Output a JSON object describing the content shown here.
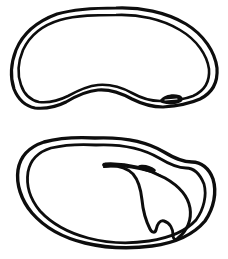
{
  "figure": {
    "title": "Bean seed",
    "caption": "",
    "background_color": "#ffffff",
    "ink_color": "#0d0d0d",
    "width": 228,
    "height": 259,
    "style": "black ink line drawing, double-contour outline",
    "view_count": 2
  },
  "chart_data": {
    "type": "line",
    "xlabel": "",
    "ylabel": "",
    "xlim": [
      0,
      228
    ],
    "ylim": [
      0,
      259
    ],
    "grid": false,
    "legend": "none",
    "series": [
      {
        "name": "top-seed-outer-contour",
        "closed": true,
        "stroke_width": 3.2,
        "x": [
          116,
          150,
          178,
          199,
          212,
          217,
          214,
          205,
          193,
          180,
          170,
          162,
          155,
          146,
          134,
          121,
          108,
          95,
          83,
          70,
          57,
          44,
          33,
          24,
          17,
          13,
          13,
          17,
          25,
          36,
          50,
          66,
          84,
          100
        ],
        "y": [
          8,
          9,
          17,
          31,
          48,
          66,
          81,
          93,
          100,
          104,
          106,
          107,
          107,
          105,
          100,
          94,
          90,
          90,
          94,
          100,
          105,
          108,
          107,
          101,
          91,
          78,
          64,
          50,
          38,
          28,
          20,
          14,
          10,
          8
        ]
      },
      {
        "name": "top-seed-inner-contour",
        "closed": true,
        "stroke_width": 2.6,
        "x": [
          116,
          148,
          173,
          192,
          204,
          209,
          206,
          198,
          187,
          175,
          166,
          158,
          150,
          141,
          130,
          118,
          106,
          94,
          83,
          71,
          59,
          47,
          37,
          29,
          23,
          20,
          20,
          24,
          32,
          42,
          55,
          70,
          86,
          101
        ],
        "y": [
          15,
          16,
          23,
          36,
          51,
          67,
          80,
          90,
          96,
          99,
          101,
          102,
          101,
          99,
          95,
          89,
          85,
          85,
          88,
          94,
          98,
          100,
          99,
          94,
          85,
          74,
          62,
          50,
          40,
          31,
          24,
          19,
          16,
          15
        ]
      },
      {
        "name": "top-seed-hilum-mark",
        "closed": true,
        "stroke_width": 1.6,
        "x": [
          163,
          168,
          174,
          179,
          182,
          181,
          177,
          171,
          166
        ],
        "y": [
          99,
          96,
          95,
          96,
          99,
          102,
          103,
          103,
          101
        ]
      },
      {
        "name": "bottom-seed-outer-contour",
        "closed": true,
        "stroke_width": 3.4,
        "x": [
          95,
          126,
          152,
          170,
          183,
          196,
          207,
          213,
          214,
          209,
          199,
          186,
          170,
          152,
          133,
          114,
          96,
          80,
          64,
          50,
          38,
          28,
          21,
          17,
          17,
          21,
          29,
          40,
          54,
          70,
          83
        ],
        "y": [
          138,
          139,
          146,
          156,
          161,
          162,
          167,
          178,
          192,
          206,
          219,
          230,
          238,
          243,
          246,
          247,
          246,
          243,
          238,
          231,
          222,
          211,
          198,
          184,
          171,
          160,
          151,
          145,
          140,
          138,
          137
        ]
      },
      {
        "name": "bottom-seed-inner-contour",
        "closed": true,
        "stroke_width": 2.8,
        "x": [
          96,
          124,
          148,
          165,
          178,
          190,
          199,
          204,
          205,
          200,
          191,
          179,
          164,
          148,
          130,
          112,
          95,
          80,
          66,
          53,
          42,
          33,
          27,
          24,
          24,
          28,
          36,
          46,
          59,
          73,
          85
        ],
        "y": [
          145,
          146,
          152,
          161,
          166,
          167,
          172,
          181,
          192,
          203,
          214,
          224,
          231,
          236,
          239,
          240,
          239,
          236,
          231,
          225,
          216,
          206,
          195,
          183,
          172,
          163,
          155,
          150,
          146,
          145,
          144
        ]
      },
      {
        "name": "bottom-seed-embryo-radicle",
        "closed": true,
        "stroke_width": 3.0,
        "x": [
          104,
          120,
          136,
          150,
          162,
          173,
          182,
          188,
          190,
          188,
          183,
          177,
          173,
          172,
          174,
          176,
          175,
          171,
          167,
          163,
          160,
          157,
          156,
          154,
          150,
          146,
          143,
          141,
          141,
          142,
          143,
          142,
          139,
          134,
          127,
          119,
          111,
          105
        ],
        "y": [
          163,
          163,
          166,
          170,
          174,
          180,
          187,
          196,
          205,
          213,
          220,
          225,
          229,
          233,
          237,
          240,
          236,
          230,
          224,
          221,
          222,
          226,
          231,
          227,
          221,
          214,
          207,
          200,
          193,
          187,
          181,
          177,
          173,
          170,
          167,
          165,
          164,
          164
        ]
      },
      {
        "name": "bottom-seed-hilum-ridge",
        "closed": false,
        "stroke_width": 2.0,
        "x": [
          104,
          116,
          128,
          139,
          148,
          155,
          160
        ],
        "y": [
          166,
          165,
          166,
          168,
          170,
          172,
          174
        ]
      }
    ],
    "annotations": [
      {
        "label": "top view: intact seed coat (testa) with hilum",
        "x": 114,
        "y": 60
      },
      {
        "label": "bottom view: seed coat opened showing embryo / radicle",
        "x": 114,
        "y": 192
      }
    ]
  }
}
